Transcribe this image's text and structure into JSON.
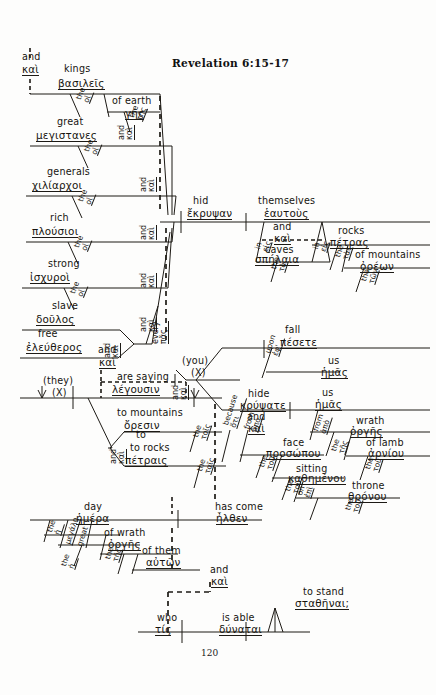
{
  "document": {
    "title": "Revelation 6:15-17",
    "page_number": "120",
    "type": "greek-sentence-diagram"
  },
  "nodes": {
    "conj_top": {
      "en": "and",
      "el": "καὶ"
    },
    "kings": {
      "en": "kings",
      "el": "βασιλεῖς"
    },
    "kings_art": {
      "en": "the",
      "el": "οἱ"
    },
    "earth": {
      "en": "of earth",
      "el": "γῆς"
    },
    "earth_art": {
      "en": "the",
      "el": "τῆς"
    },
    "great": {
      "en": "great",
      "el": "μεγιστανες"
    },
    "great_art": {
      "en": "the",
      "el": "οἱ"
    },
    "generals": {
      "en": "generals",
      "el": "χιλίαρχοι"
    },
    "generals_art": {
      "en": "the",
      "el": "οἱ"
    },
    "rich": {
      "en": "rich",
      "el": "πλούσιοι"
    },
    "rich_art": {
      "en": "the",
      "el": "οἱ"
    },
    "strong": {
      "en": "strong",
      "el": "ἰσχυροὶ"
    },
    "strong_art": {
      "en": "the",
      "el": "οἱ"
    },
    "slave": {
      "en": "slave",
      "el": "δοῦλος"
    },
    "free": {
      "en": "free",
      "el": "ἐλεύθερος"
    },
    "every": {
      "en": "every",
      "el": "πᾶς"
    },
    "and_series_1": {
      "en": "and",
      "el": "καὶ"
    },
    "and_series_2": {
      "en": "and",
      "el": "καὶ"
    },
    "and_series_3": {
      "en": "and",
      "el": "καὶ"
    },
    "and_series_4": {
      "en": "and",
      "el": "καὶ"
    },
    "and_series_5": {
      "en": "and",
      "el": "καὶ"
    },
    "and_series_6": {
      "en": "and",
      "el": "καὶ"
    },
    "hid": {
      "en": "hid",
      "el": "ἔκρυψαν"
    },
    "themselves": {
      "en": "themselves",
      "el": "ἑαυτοὺς"
    },
    "and_caves": {
      "en": "and",
      "el": "καὶ"
    },
    "caves": {
      "en": "caves",
      "el": "σπήλαια"
    },
    "caves_prep": {
      "en": "in",
      "el": "εἰς"
    },
    "caves_art": {
      "en": "the",
      "el": "τὰ"
    },
    "rocks_prep": {
      "en": "in",
      "el": "εἰς"
    },
    "rocks": {
      "en": "rocks",
      "el": "πέτρας"
    },
    "rocks_art": {
      "en": "the",
      "el": "τὰς"
    },
    "mountains_gen": {
      "en": "of mountains",
      "el": "ὀρέων"
    },
    "mountains_gen_art": {
      "en": "the",
      "el": "τῶν"
    },
    "they_subj": {
      "en": "(they)",
      "el": "(X)"
    },
    "and_saying": {
      "en": "and",
      "el": "καὶ"
    },
    "are_saying": {
      "en": "are saying",
      "el": "λέγουσιν"
    },
    "to_mountains": {
      "en": "to mountains",
      "el": "ὄρεσιν"
    },
    "to_mountains_art": {
      "en": "the",
      "el": "τοῖς"
    },
    "and_rocks": {
      "en": "and",
      "el": "καὶ"
    },
    "to_rocks": {
      "en": "to rocks",
      "el": "πέτραις"
    },
    "to_rocks_art": {
      "en": "the",
      "el": "ταῖς"
    },
    "you_subj": {
      "en": "(you)",
      "el": "(X)"
    },
    "and_fall": {
      "en": "and",
      "el": "καὶ"
    },
    "fall": {
      "en": "fall",
      "el": "πέσετε"
    },
    "upon": {
      "en": "upon",
      "el": "ἐφ'"
    },
    "us_1": {
      "en": "us",
      "el": "ἡμᾶς"
    },
    "hide": {
      "en": "hide",
      "el": "κρύψατε"
    },
    "us_2": {
      "en": "us",
      "el": "ἡμᾶς"
    },
    "and_hide": {
      "en": "and",
      "el": "καὶ"
    },
    "because": {
      "en": "because",
      "el": "ὅτι"
    },
    "from_1": {
      "en": "from",
      "el": "ἀπὸ"
    },
    "face": {
      "en": "face",
      "el": "προσώπου"
    },
    "face_art": {
      "en": "the",
      "el": "τοῦ"
    },
    "sitting": {
      "en": "sitting",
      "el": "καθημένου"
    },
    "sitting_art": {
      "en": "the",
      "el": "τοῦ"
    },
    "on_throne": {
      "en": "on",
      "el": "ἐπὶ"
    },
    "throne": {
      "en": "throne",
      "el": "θρόνου"
    },
    "throne_art": {
      "en": "the",
      "el": "τοῦ"
    },
    "from_2": {
      "en": "from",
      "el": "ἀπὸ"
    },
    "wrath": {
      "en": "wrath",
      "el": "ὀργῆς"
    },
    "wrath_art": {
      "en": "the",
      "el": "τῆς"
    },
    "lamb": {
      "en": "of lamb",
      "el": "ἀρνίου"
    },
    "lamb_art": {
      "en": "the",
      "el": "τοῦ"
    },
    "day": {
      "en": "day",
      "el": "ἡμέρα"
    },
    "day_art": {
      "en": "the",
      "el": "ἡ"
    },
    "day_great": {
      "en": "great",
      "el": "μεγάλη"
    },
    "day_great_art": {
      "en": "the",
      "el": "ἡ"
    },
    "of_wrath": {
      "en": "of wrath",
      "el": "ὀργῆς"
    },
    "of_wrath_art": {
      "en": "the",
      "el": "τῆς"
    },
    "of_them": {
      "en": "of them",
      "el": "αὐτῶν"
    },
    "has_come": {
      "en": "has come",
      "el": "ἦλθεν"
    },
    "and_bottom": {
      "en": "and",
      "el": "καὶ"
    },
    "and_who": {
      "en": "and",
      "el": "καὶ"
    },
    "who": {
      "en": "who",
      "el": "τίς"
    },
    "is_able": {
      "en": "is able",
      "el": "δύναται"
    },
    "to_stand": {
      "en": "to stand",
      "el": "σταθῆναι;"
    }
  }
}
